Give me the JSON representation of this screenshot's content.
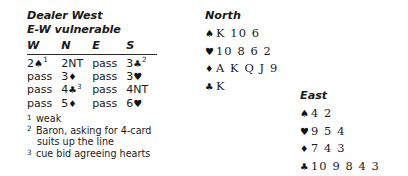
{
  "deal": {
    "dealer_line": "Dealer West",
    "vulnerability_line": "E-W vulnerable"
  },
  "auction": {
    "columns": [
      "W",
      "N",
      "E",
      "S"
    ],
    "rows": [
      [
        {
          "text": "2",
          "suit": "♠",
          "sup": "1"
        },
        {
          "text": "2NT",
          "suit": "",
          "sup": ""
        },
        {
          "text": "pass",
          "suit": "",
          "sup": ""
        },
        {
          "text": "3",
          "suit": "♣",
          "sup": "2"
        }
      ],
      [
        {
          "text": "pass",
          "suit": "",
          "sup": ""
        },
        {
          "text": "3",
          "suit": "♦",
          "sup": ""
        },
        {
          "text": "pass",
          "suit": "",
          "sup": ""
        },
        {
          "text": "3",
          "suit": "♥",
          "sup": ""
        }
      ],
      [
        {
          "text": "pass",
          "suit": "",
          "sup": ""
        },
        {
          "text": "4",
          "suit": "♣",
          "sup": "3"
        },
        {
          "text": "pass",
          "suit": "",
          "sup": ""
        },
        {
          "text": "4NT",
          "suit": "",
          "sup": ""
        }
      ],
      [
        {
          "text": "pass",
          "suit": "",
          "sup": ""
        },
        {
          "text": "5",
          "suit": "♦",
          "sup": ""
        },
        {
          "text": "pass",
          "suit": "",
          "sup": ""
        },
        {
          "text": "6",
          "suit": "♥",
          "sup": ""
        }
      ]
    ]
  },
  "footnotes": [
    {
      "marker": "1",
      "text": "weak",
      "text_cont": ""
    },
    {
      "marker": "2",
      "text": "Baron, asking for 4-card",
      "text_cont": "suits up the line"
    },
    {
      "marker": "3",
      "text": "cue bid agreeing hearts",
      "text_cont": ""
    }
  ],
  "hands": {
    "north": {
      "label": "North",
      "suits": [
        {
          "symbol": "♠",
          "cards": "K 10 6"
        },
        {
          "symbol": "♥",
          "cards": "10 8 6 2"
        },
        {
          "symbol": "♦",
          "cards": "A K Q J 9"
        },
        {
          "symbol": "♣",
          "cards": "K"
        }
      ]
    },
    "east": {
      "label": "East",
      "suits": [
        {
          "symbol": "♠",
          "cards": "4 2"
        },
        {
          "symbol": "♥",
          "cards": "9 5 4"
        },
        {
          "symbol": "♦",
          "cards": "7 4 3"
        },
        {
          "symbol": "♣",
          "cards": "10 9 8 4 3"
        }
      ]
    }
  },
  "colors": {
    "text": "#1a1a1a",
    "rule": "#2b2b2b",
    "background": "#ffffff"
  }
}
